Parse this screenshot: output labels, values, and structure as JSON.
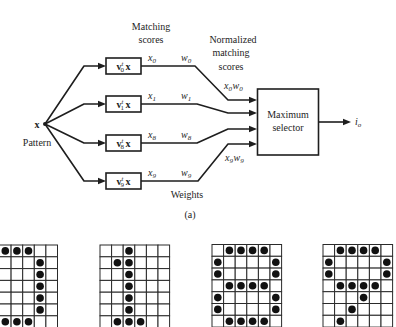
{
  "figure": {
    "caption": "(a)",
    "matching_scores_label": [
      "Matching",
      "scores"
    ],
    "normalized_label": [
      "Normalized",
      "matching",
      "scores"
    ],
    "weights_label": "Weights",
    "input": {
      "symbol": "x",
      "label": "Pattern"
    },
    "selector": {
      "lines": [
        "Maximum",
        "selector"
      ]
    },
    "output": {
      "base": "i",
      "sub": "o"
    },
    "branches": [
      {
        "box": {
          "v": "v",
          "sup": "t",
          "sub": "0",
          "x": "x"
        },
        "score": {
          "base": "x",
          "sub": "0"
        },
        "weight": {
          "base": "w",
          "sub": "0"
        }
      },
      {
        "box": {
          "v": "v",
          "sup": "t",
          "sub": "1",
          "x": "x"
        },
        "score": {
          "base": "x",
          "sub": "1"
        },
        "weight": {
          "base": "w",
          "sub": "1"
        }
      },
      {
        "box": {
          "v": "v",
          "sup": "t",
          "sub": "8",
          "x": "x"
        },
        "score": {
          "base": "x",
          "sub": "8"
        },
        "weight": {
          "base": "w",
          "sub": "8"
        }
      },
      {
        "box": {
          "v": "v",
          "sup": "t",
          "sub": "9",
          "x": "x"
        },
        "score": {
          "base": "x",
          "sub": "9"
        },
        "weight": {
          "base": "w",
          "sub": "9"
        }
      }
    ],
    "normalized_products": [
      {
        "x": "x",
        "xs": "0",
        "w": "w",
        "ws": "0"
      },
      {
        "x": "x",
        "xs": "9",
        "w": "w",
        "ws": "9"
      }
    ]
  },
  "patterns": [
    {
      "name": "digit-0-partial",
      "rows": [
        "###..",
        "...#.",
        "...#.",
        "...#.",
        "...#.",
        "...#.",
        "###.."
      ]
    },
    {
      "name": "digit-1",
      "rows": [
        "..#...",
        ".##...",
        "..#...",
        "..#...",
        "..#...",
        "..#...",
        ".###.."
      ]
    },
    {
      "name": "digit-8",
      "rows": [
        ".####.",
        "#....#",
        "#....#",
        ".####.",
        "#....#",
        "#....#",
        ".####."
      ]
    },
    {
      "name": "digit-9",
      "rows": [
        ".####.",
        "#....#",
        "#....#",
        ".####.",
        "...#..",
        "..#...",
        ".#...."
      ]
    }
  ]
}
